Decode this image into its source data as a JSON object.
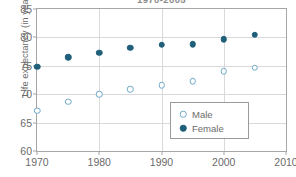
{
  "chart_data": {
    "type": "scatter",
    "title": "1970-2005",
    "xlabel": "",
    "ylabel": "Life expectancy (in years)",
    "xlim": [
      1970,
      2010
    ],
    "ylim": [
      60,
      85
    ],
    "xticks": [
      1970,
      1980,
      1990,
      2000,
      2010
    ],
    "yticks": [
      60,
      65,
      70,
      75,
      80,
      85
    ],
    "grid": true,
    "legend_position": "lower right",
    "x": [
      1970,
      1975,
      1980,
      1985,
      1990,
      1995,
      2000,
      2005
    ],
    "series": [
      {
        "name": "Male",
        "marker": "open-circle",
        "color": "#6fa8c8",
        "values": [
          67.1,
          68.7,
          70.0,
          70.9,
          71.6,
          72.3,
          74.0,
          74.7
        ]
      },
      {
        "name": "Female",
        "marker": "filled-circle",
        "color": "#1f5f7a",
        "values": [
          74.8,
          76.5,
          77.3,
          78.2,
          78.7,
          78.8,
          79.7,
          80.5
        ]
      }
    ]
  },
  "legend": {
    "entries": [
      {
        "label": "Male"
      },
      {
        "label": "Female"
      }
    ]
  }
}
